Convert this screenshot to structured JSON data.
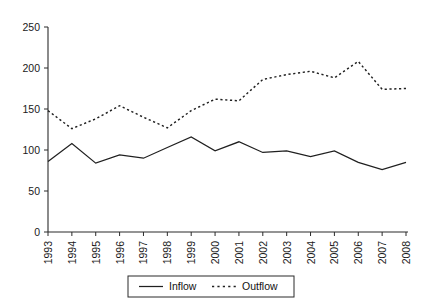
{
  "chart_data": {
    "type": "line",
    "title": "",
    "xlabel": "",
    "ylabel": "",
    "categories": [
      "1993",
      "1994",
      "1995",
      "1996",
      "1997",
      "1998",
      "1999",
      "2000",
      "2001",
      "2002",
      "2003",
      "2004",
      "2005",
      "2006",
      "2007",
      "2008"
    ],
    "series": [
      {
        "name": "Inflow",
        "style": "solid",
        "values": [
          86,
          108,
          84,
          94,
          90,
          103,
          116,
          99,
          110,
          97,
          99,
          92,
          99,
          85,
          76,
          85
        ]
      },
      {
        "name": "Outflow",
        "style": "dotted",
        "values": [
          148,
          126,
          138,
          154,
          140,
          127,
          148,
          162,
          160,
          186,
          192,
          196,
          188,
          208,
          174,
          175
        ]
      }
    ],
    "ylim": [
      0,
      250
    ],
    "yticks": [
      0,
      50,
      100,
      150,
      200,
      250
    ],
    "ytick_labels": [
      "0",
      "50",
      "100",
      "150",
      "200",
      "250"
    ],
    "xtick_labels": [
      "1993",
      "1994",
      "1995",
      "1996",
      "1997",
      "1998",
      "1999",
      "2000",
      "2001",
      "2002",
      "2003",
      "2004",
      "2005",
      "2006",
      "2007",
      "2008"
    ],
    "grid": false,
    "legend_position": "bottom-center",
    "legend_entries": [
      {
        "label": "Inflow",
        "style": "solid"
      },
      {
        "label": "Outflow",
        "style": "dotted"
      }
    ],
    "axis_color": "#2b2b2b",
    "series_color": "#202020"
  }
}
